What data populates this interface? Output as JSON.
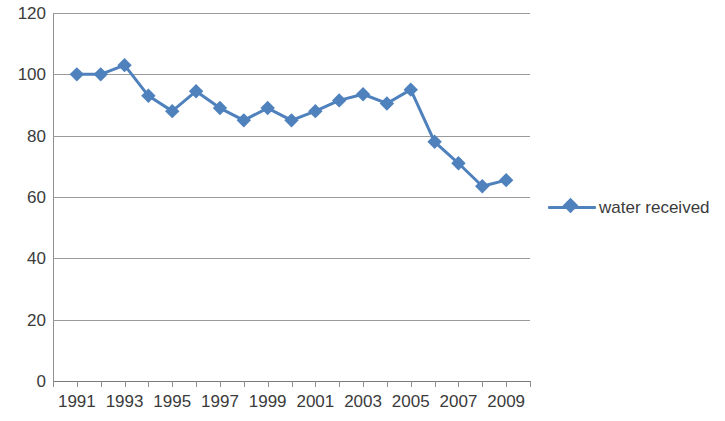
{
  "chart_data": {
    "type": "line",
    "title": "",
    "xlabel": "",
    "ylabel": "",
    "grid": true,
    "legend_position": "right",
    "xlim": [
      1990,
      2010
    ],
    "ylim": [
      0,
      120
    ],
    "ytick_labels": [
      "120",
      "100",
      "80",
      "60",
      "40",
      "20",
      "0"
    ],
    "ytick_values": [
      120,
      100,
      80,
      60,
      40,
      20,
      0
    ],
    "xtick_labels": [
      "1991",
      "1993",
      "1995",
      "1997",
      "1999",
      "2001",
      "2003",
      "2005",
      "2007",
      "2009"
    ],
    "xtick_values": [
      1991,
      1993,
      1995,
      1997,
      1999,
      2001,
      2003,
      2005,
      2007,
      2009
    ],
    "x": [
      1991,
      1992,
      1993,
      1994,
      1995,
      1996,
      1997,
      1998,
      1999,
      2000,
      2001,
      2002,
      2003,
      2004,
      2005,
      2006,
      2007,
      2008,
      2009
    ],
    "series": [
      {
        "name": "water received",
        "color": "#4f81bd",
        "marker": "diamond",
        "values": [
          100,
          100,
          103,
          93,
          88,
          94.5,
          89,
          85,
          89,
          85,
          88,
          91.5,
          93.5,
          90.5,
          95,
          78,
          71,
          63.5,
          65.5
        ]
      }
    ]
  },
  "legend": {
    "entries": [
      {
        "label": "water received",
        "color": "#4f81bd"
      }
    ]
  },
  "axes": {
    "grid_color": "#9a9a9a",
    "axis_color": "#8f8f8f",
    "text_color": "#3b3b3b"
  }
}
